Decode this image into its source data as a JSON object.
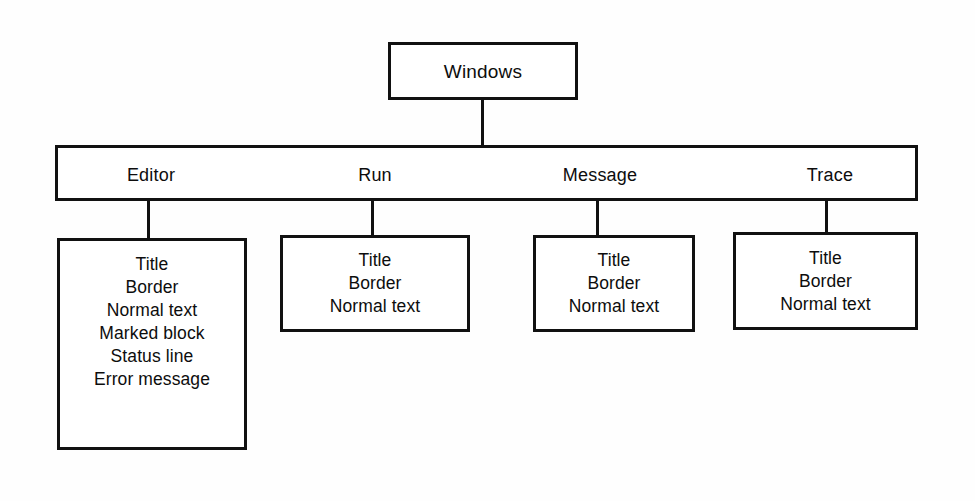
{
  "diagram": {
    "type": "hierarchy-tree",
    "background_color": "#ffffff",
    "line_color": "#111111",
    "root": {
      "label": "Windows"
    },
    "categories": [
      {
        "label": "Editor"
      },
      {
        "label": "Run"
      },
      {
        "label": "Message"
      },
      {
        "label": "Trace"
      }
    ],
    "details": [
      {
        "parent": "Editor",
        "items": [
          "Title",
          "Border",
          "Normal text",
          "Marked block",
          "Status line",
          "Error message"
        ],
        "text": "Title\nBorder\nNormal text\nMarked block\nStatus line\nError message"
      },
      {
        "parent": "Run",
        "items": [
          "Title",
          "Border",
          "Normal text"
        ],
        "text": "Title\nBorder\nNormal text"
      },
      {
        "parent": "Message",
        "items": [
          "Title",
          "Border",
          "Normal text"
        ],
        "text": "Title\nBorder\nNormal text"
      },
      {
        "parent": "Trace",
        "items": [
          "Title",
          "Border",
          "Normal text"
        ],
        "text": "Title\nBorder\nNormal text"
      }
    ]
  }
}
